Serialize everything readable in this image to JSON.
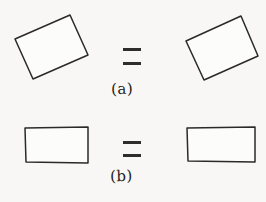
{
  "figure": {
    "background_color": "#f8f7f5",
    "ink_color": "#2b2a28",
    "panels": [
      {
        "id": "a",
        "label": "(a)",
        "relation_symbol": "=",
        "shapes": [
          {
            "name": "tilted-rectangle-left",
            "kind": "quadrilateral",
            "orientation": "tilted",
            "points": [
              [
                15,
                39
              ],
              [
                70,
                15
              ],
              [
                88,
                55
              ],
              [
                33,
                79
              ]
            ]
          },
          {
            "name": "tilted-rectangle-right",
            "kind": "quadrilateral",
            "orientation": "tilted",
            "points": [
              [
                186,
                41
              ],
              [
                241,
                16
              ],
              [
                258,
                56
              ],
              [
                204,
                80
              ]
            ]
          }
        ],
        "equals": {
          "bars": [
            {
              "x": 123,
              "y": 48,
              "width": 18,
              "height": 3
            },
            {
              "x": 123,
              "y": 62,
              "width": 18,
              "height": 3
            }
          ]
        }
      },
      {
        "id": "b",
        "label": "(b)",
        "relation_symbol": "=",
        "shapes": [
          {
            "name": "axis-aligned-rectangle-left",
            "kind": "quadrilateral",
            "orientation": "upright",
            "points": [
              [
                25,
                128
              ],
              [
                88,
                127
              ],
              [
                88,
                163
              ],
              [
                26,
                162
              ]
            ]
          },
          {
            "name": "axis-aligned-rectangle-right",
            "kind": "quadrilateral",
            "orientation": "upright",
            "points": [
              [
                187,
                128
              ],
              [
                255,
                127
              ],
              [
                255,
                162
              ],
              [
                188,
                161
              ]
            ]
          }
        ],
        "equals": {
          "bars": [
            {
              "x": 123,
              "y": 141,
              "width": 18,
              "height": 3
            },
            {
              "x": 123,
              "y": 154,
              "width": 18,
              "height": 3
            }
          ]
        }
      }
    ]
  }
}
